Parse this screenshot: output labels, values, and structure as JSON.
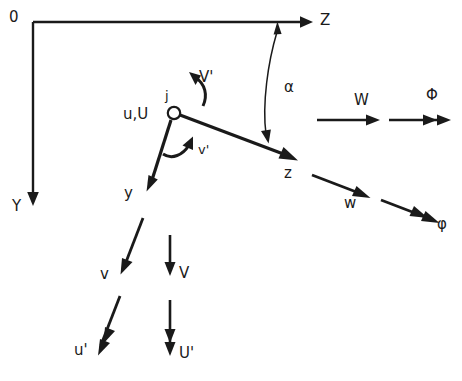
{
  "diagram": {
    "type": "vector-diagram",
    "background_color": "#ffffff",
    "ink_color": "#1a1a1a"
  },
  "global_axes": {
    "origin_label": "0",
    "horizontal_axis_label": "Z",
    "vertical_axis_label": "Y",
    "origin_point": [
      33,
      22
    ],
    "horizontal_end": [
      310,
      22
    ],
    "vertical_end": [
      33,
      205
    ]
  },
  "joint": {
    "marker_label": "j",
    "displacement_label": "u,U",
    "center": [
      174,
      113
    ],
    "radius": 6
  },
  "local_axes": {
    "z_label": "z",
    "y_label": "y",
    "z_end": [
      297,
      160
    ],
    "y_end": [
      147,
      190
    ]
  },
  "angle": {
    "label": "α",
    "description": "angle between global Z and local z"
  },
  "rotation_arrows": [
    {
      "name": "global-rotation",
      "label": "V'"
    },
    {
      "name": "local-rotation",
      "label": "v'"
    }
  ],
  "translation_vectors": [
    {
      "name": "global-W",
      "label": "W",
      "head": "single",
      "orientation": "horizontal"
    },
    {
      "name": "global-Phi",
      "label": "Φ",
      "head": "double",
      "orientation": "horizontal"
    },
    {
      "name": "local-w",
      "label": "w",
      "head": "single",
      "orientation": "inclined"
    },
    {
      "name": "local-phi",
      "label": "φ",
      "head": "double",
      "orientation": "inclined"
    },
    {
      "name": "local-v",
      "label": "v",
      "head": "single",
      "orientation": "inclined-down"
    },
    {
      "name": "global-V",
      "label": "V",
      "head": "single",
      "orientation": "vertical"
    },
    {
      "name": "local-u-prime",
      "label": "u'",
      "head": "double",
      "orientation": "inclined-down"
    },
    {
      "name": "global-U-prime",
      "label": "U'",
      "head": "double",
      "orientation": "vertical"
    }
  ],
  "labels": {
    "origin": "0",
    "axis_Z": "Z",
    "axis_Y": "Y",
    "joint_j": "j",
    "joint_uU": "u,U",
    "alpha": "α",
    "V_prime": "V'",
    "v_prime": "v'",
    "local_z": "z",
    "local_y": "y",
    "W": "W",
    "Phi": "Φ",
    "w": "w",
    "phi": "φ",
    "v": "v",
    "V": "V",
    "u_prime": "u'",
    "U_prime": "U'"
  }
}
